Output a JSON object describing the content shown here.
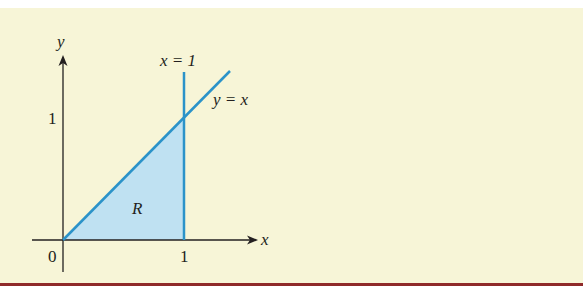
{
  "figure": {
    "axes": {
      "x_label": "x",
      "y_label": "y",
      "origin_label": "0",
      "x_tick_label": "1",
      "y_tick_label": "1"
    },
    "curves": {
      "vertical_line_label": "x = 1",
      "diagonal_line_label": "y = x"
    },
    "region_label": "R",
    "colors": {
      "background": "#f7f5d7",
      "line": "#2b93c9",
      "fill": "#bfe1f2",
      "axis": "#231f20",
      "rule": "#8f2a2a"
    }
  }
}
